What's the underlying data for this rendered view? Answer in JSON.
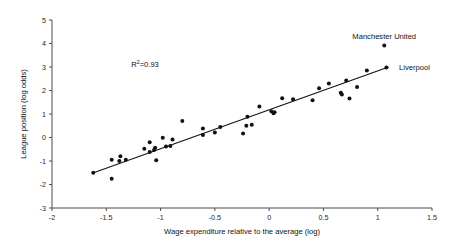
{
  "chart_data": {
    "type": "scatter",
    "title": "",
    "xlabel": "Wage expenditure relative to the average (log)",
    "ylabel": "League position (log odds)",
    "xlim": [
      -2,
      1.5
    ],
    "ylim": [
      -3,
      5
    ],
    "xticks": [
      "-2",
      "-1.5",
      "-1",
      "-0.5",
      "0",
      "0.5",
      "1",
      "1.5"
    ],
    "xtick_values": [
      -2,
      -1.5,
      -1,
      -0.5,
      0,
      0.5,
      1,
      1.5
    ],
    "yticks": [
      "-3",
      "-2",
      "-1",
      "0",
      "1",
      "2",
      "3",
      "4",
      "5"
    ],
    "ytick_values": [
      -3,
      -2,
      -1,
      0,
      1,
      2,
      3,
      4,
      5
    ],
    "grid": false,
    "legend": "none",
    "annotations": [
      {
        "name": "r-squared",
        "text_prefix": "R",
        "text_sup": "2",
        "text_suffix": "=0.93",
        "x": -1.27,
        "y": 3.0
      }
    ],
    "series": [
      {
        "name": "clubs",
        "marker": "circle",
        "color": "#111111",
        "points": [
          {
            "x": -1.62,
            "y": -1.5,
            "label": ""
          },
          {
            "x": -1.45,
            "y": -1.75,
            "label": ""
          },
          {
            "x": -1.45,
            "y": -0.95,
            "label": ""
          },
          {
            "x": -1.38,
            "y": -1.0,
            "label": ""
          },
          {
            "x": -1.37,
            "y": -0.8,
            "label": ""
          },
          {
            "x": -1.32,
            "y": -0.95,
            "label": ""
          },
          {
            "x": -1.15,
            "y": -0.48,
            "label": ""
          },
          {
            "x": -1.1,
            "y": -0.2,
            "label": ""
          },
          {
            "x": -1.1,
            "y": -0.62,
            "label": ""
          },
          {
            "x": -1.06,
            "y": -0.53,
            "label": ""
          },
          {
            "x": -1.05,
            "y": -0.44,
            "label": ""
          },
          {
            "x": -1.04,
            "y": -0.97,
            "label": ""
          },
          {
            "x": -0.98,
            "y": -0.01,
            "label": ""
          },
          {
            "x": -0.95,
            "y": -0.38,
            "label": ""
          },
          {
            "x": -0.89,
            "y": -0.08,
            "label": ""
          },
          {
            "x": -0.91,
            "y": -0.36,
            "label": ""
          },
          {
            "x": -0.8,
            "y": 0.7,
            "label": ""
          },
          {
            "x": -0.61,
            "y": 0.38,
            "label": ""
          },
          {
            "x": -0.61,
            "y": 0.11,
            "label": ""
          },
          {
            "x": -0.5,
            "y": 0.21,
            "label": ""
          },
          {
            "x": -0.45,
            "y": 0.45,
            "label": ""
          },
          {
            "x": -0.24,
            "y": 0.17,
            "label": ""
          },
          {
            "x": -0.21,
            "y": 0.5,
            "label": ""
          },
          {
            "x": -0.2,
            "y": 0.88,
            "label": ""
          },
          {
            "x": -0.16,
            "y": 0.54,
            "label": ""
          },
          {
            "x": -0.09,
            "y": 1.32,
            "label": ""
          },
          {
            "x": 0.02,
            "y": 1.12,
            "label": ""
          },
          {
            "x": 0.04,
            "y": 1.03,
            "label": ""
          },
          {
            "x": 0.05,
            "y": 1.07,
            "label": ""
          },
          {
            "x": 0.12,
            "y": 1.67,
            "label": ""
          },
          {
            "x": 0.22,
            "y": 1.63,
            "label": ""
          },
          {
            "x": 0.4,
            "y": 1.59,
            "label": ""
          },
          {
            "x": 0.46,
            "y": 2.1,
            "label": ""
          },
          {
            "x": 0.55,
            "y": 2.3,
            "label": ""
          },
          {
            "x": 0.66,
            "y": 1.9,
            "label": ""
          },
          {
            "x": 0.67,
            "y": 1.83,
            "label": ""
          },
          {
            "x": 0.71,
            "y": 2.43,
            "label": ""
          },
          {
            "x": 0.74,
            "y": 1.66,
            "label": ""
          },
          {
            "x": 0.81,
            "y": 2.15,
            "label": ""
          },
          {
            "x": 0.9,
            "y": 2.85,
            "label": ""
          },
          {
            "x": 1.06,
            "y": 3.92,
            "label": "Manchester United"
          },
          {
            "x": 1.08,
            "y": 2.98,
            "label": "Liverpool"
          }
        ]
      }
    ],
    "fit_line": {
      "name": "regression-line",
      "x_start": -1.63,
      "y_start": -1.52,
      "x_end": 1.1,
      "y_end": 3.0
    },
    "point_labels": [
      {
        "name": "manchester-united",
        "text": "Manchester United",
        "x": 1.06,
        "y": 4.3,
        "anchor": "middle"
      },
      {
        "name": "liverpool",
        "text": "Liverpool",
        "x": 1.15,
        "y": 2.98,
        "anchor": "start"
      }
    ]
  }
}
